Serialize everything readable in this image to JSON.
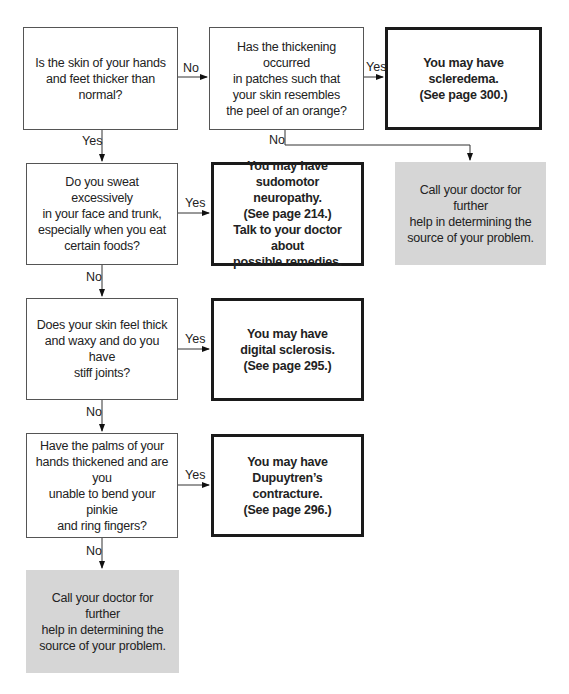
{
  "flowchart": {
    "nodes": {
      "q1": "Is the skin of your hands\nand feet thicker than\nnormal?",
      "q2": "Has the thickening occurred\nin patches such that\nyour skin resembles\nthe peel of an orange?",
      "r_scleredema": "You may have\nscleredema.\n(See page 300.)",
      "call_doctor_1": "Call your doctor for further\nhelp in determining the\nsource of your problem.",
      "q3": "Do you sweat excessively\nin your face and trunk,\nespecially when you eat\ncertain foods?",
      "r_sudomotor": "You may have sudomotor\nneuropathy.\n(See page 214.)\nTalk to your doctor about\npossible remedies.",
      "q4": "Does your skin feel thick\nand waxy and do you have\nstiff joints?",
      "r_digital": "You may have\ndigital sclerosis.\n(See page 295.)",
      "q5": "Have the palms of your\nhands thickened and are you\nunable to bend your pinkie\nand ring fingers?",
      "r_dupuytren": "You may have\nDupuytren’s contracture.\n(See page 296.)",
      "call_doctor_2": "Call your doctor for further\nhelp in determining the\nsource of your problem."
    },
    "edges": {
      "q1_no": "No",
      "q1_yes": "Yes",
      "q2_yes": "Yes",
      "q2_no": "No",
      "q3_yes": "Yes",
      "q3_no": "No",
      "q4_yes": "Yes",
      "q4_no": "No",
      "q5_yes": "Yes",
      "q5_no": "No"
    },
    "colors": {
      "question_border": "#555555",
      "result_border": "#1a1a1a",
      "terminal_fill": "#d6d6d6"
    }
  }
}
